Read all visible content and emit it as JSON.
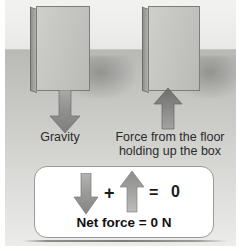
{
  "figure": {
    "scene": {
      "wall_color": "#ececeb",
      "floor_color": "#c8c8c5",
      "box_color": "#c6c6c3",
      "arrow_color": "#8c8c89"
    },
    "labels": {
      "gravity": "Gravity",
      "floor_force_line1": "Force from the floor",
      "floor_force_line2": "holding up the box"
    },
    "arrows": [
      {
        "name": "gravity-arrow",
        "direction": "down",
        "meaning": "Gravity"
      },
      {
        "name": "normal-force-arrow",
        "direction": "up",
        "meaning": "Force from the floor holding up the box"
      }
    ],
    "equation": {
      "down_arrow_symbol": "down-arrow",
      "plus": "+",
      "up_arrow_symbol": "up-arrow",
      "equals": "=",
      "result": "0",
      "net_force": "Net force = 0 N"
    }
  }
}
